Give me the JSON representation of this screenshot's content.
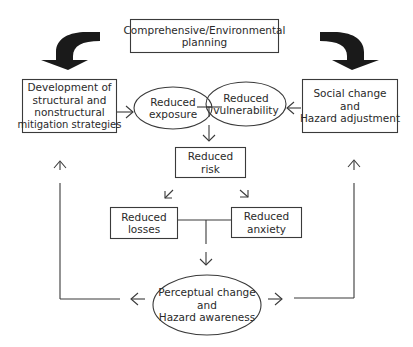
{
  "diagram": {
    "nodes": {
      "planning": {
        "lines": [
          "Comprehensive/Environmental",
          "planning"
        ],
        "shape": "box"
      },
      "development": {
        "lines": [
          "Development of",
          "structural and",
          "nonstructural",
          "mitigation strategies"
        ],
        "shape": "box"
      },
      "social": {
        "lines": [
          "Social change",
          "and",
          "Hazard adjustment"
        ],
        "shape": "box"
      },
      "exposure": {
        "lines": [
          "Reduced",
          "exposure"
        ],
        "shape": "ellipse"
      },
      "vulnerability": {
        "lines": [
          "Reduced",
          "vulnerability"
        ],
        "shape": "ellipse"
      },
      "risk": {
        "lines": [
          "Reduced",
          "risk"
        ],
        "shape": "box"
      },
      "losses": {
        "lines": [
          "Reduced",
          "losses"
        ],
        "shape": "box"
      },
      "anxiety": {
        "lines": [
          "Reduced",
          "anxiety"
        ],
        "shape": "box"
      },
      "perceptual": {
        "lines": [
          "Perceptual change",
          "and",
          "Hazard awareness"
        ],
        "shape": "ellipse"
      }
    },
    "edges": [
      {
        "from": "planning",
        "to": "development",
        "style": "bold-curved-arrow"
      },
      {
        "from": "planning",
        "to": "social",
        "style": "bold-curved-arrow"
      },
      {
        "from": "development",
        "to": "exposure",
        "style": "arrow"
      },
      {
        "from": "social",
        "to": "vulnerability",
        "style": "arrow"
      },
      {
        "from": "exposure+vulnerability",
        "to": "risk",
        "style": "arrow"
      },
      {
        "from": "risk",
        "to": "losses",
        "style": "arrow"
      },
      {
        "from": "risk",
        "to": "anxiety",
        "style": "arrow"
      },
      {
        "from": "losses+anxiety",
        "to": "perceptual",
        "style": "arrow"
      },
      {
        "from": "perceptual",
        "to": "development",
        "style": "loop-arrow"
      },
      {
        "from": "perceptual",
        "to": "social",
        "style": "loop-arrow"
      }
    ],
    "colors": {
      "line": "#3a3a3a",
      "text": "#2a2a2a",
      "fill": "#ffffff",
      "bold_arrow": "#1a1a1a"
    }
  }
}
